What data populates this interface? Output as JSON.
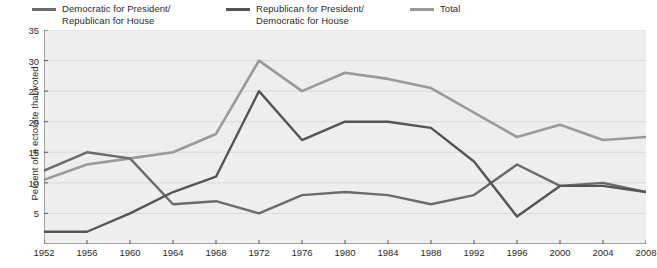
{
  "chart": {
    "type": "line",
    "title": "",
    "ylabel": "Percent of e ectorate that voted",
    "xlabel": ""
  },
  "legend": {
    "position": "top",
    "items": [
      {
        "label": "Democratic for President/\nRepublican for House",
        "color": "#6b6b6b",
        "name": "dem-pres-rep-house"
      },
      {
        "label": "Republican for President/\nDemocratic for House",
        "color": "#555555",
        "name": "rep-pres-dem-house"
      },
      {
        "label": "Total",
        "color": "#9a9a9a",
        "name": "total"
      }
    ]
  },
  "axes": {
    "y": {
      "ticks": [
        "5",
        "10",
        "15",
        "20",
        "25",
        "30",
        "35"
      ],
      "values": [
        5,
        10,
        15,
        20,
        25,
        30,
        35
      ],
      "min": 0,
      "max": 35
    },
    "x": {
      "ticks": [
        "1952",
        "1956",
        "1960",
        "1964",
        "1968",
        "1972",
        "1976",
        "1980",
        "1984",
        "1988",
        "1992",
        "1996",
        "2000",
        "2004",
        "2008"
      ]
    }
  },
  "chart_data": {
    "type": "line",
    "title": "",
    "xlabel": "",
    "ylabel": "Percent of e ectorate that voted",
    "ylim": [
      0,
      35
    ],
    "grid": true,
    "legend_position": "top",
    "categories": [
      "1952",
      "1956",
      "1960",
      "1964",
      "1968",
      "1972",
      "1976",
      "1980",
      "1984",
      "1988",
      "1992",
      "1996",
      "2000",
      "2004",
      "2008"
    ],
    "x": [
      1952,
      1956,
      1960,
      1964,
      1968,
      1972,
      1976,
      1980,
      1984,
      1988,
      1992,
      1996,
      2000,
      2004,
      2008
    ],
    "series": [
      {
        "name": "Democratic for President/Republican for House",
        "color": "#6b6b6b",
        "values": [
          12,
          15,
          14,
          6.5,
          7,
          5,
          8,
          8.5,
          8,
          6.5,
          8,
          13,
          9.5,
          10,
          8.5
        ]
      },
      {
        "name": "Republican for President/Democratic for House",
        "color": "#555555",
        "values": [
          2,
          2,
          5,
          8.5,
          11,
          25,
          17,
          20,
          20,
          19,
          13.5,
          4.5,
          9.5,
          9.5,
          8.5
        ]
      },
      {
        "name": "Total",
        "color": "#9a9a9a",
        "values": [
          10.5,
          13,
          14,
          15,
          18,
          30,
          25,
          28,
          27,
          25.5,
          21.5,
          17.5,
          19.5,
          17,
          17.5
        ]
      }
    ]
  },
  "colors": {
    "plot_background": "#eeeeee",
    "gridline": "#d9d9d9",
    "axis": "#5a5a5a",
    "text": "#2a2a2a"
  }
}
